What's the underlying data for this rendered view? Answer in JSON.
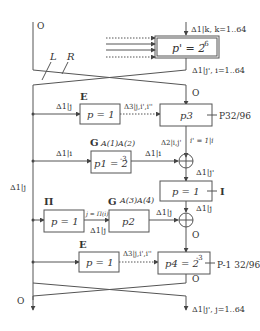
{
  "diagram": {
    "type": "differential-characteristic-round",
    "top_block": {
      "label": "p' = 2",
      "exp": "-6",
      "input_delta": "Δ1|k, k=1..64",
      "output_delta": "Δ1|j', i=1..64"
    },
    "labels": {
      "O_top_left": "O",
      "L": "L",
      "R": "R",
      "O_right_top": "O",
      "O_bottom_left": "O",
      "O_bottom_right": "O",
      "O_after_sum": "O",
      "left_delta": "Δ1|j"
    },
    "blocks": [
      {
        "id": "E1",
        "tag": "E",
        "label": "p = 1",
        "in": "Δ1|j",
        "out": "Δ3|j,i',i''"
      },
      {
        "id": "P3",
        "label": "p3",
        "side": "P32/96"
      },
      {
        "id": "G1",
        "tag": "G",
        "tag_extra": "A(1)A(2)",
        "label": "p1 = 2",
        "exp": "-3",
        "in": "Δ1|i",
        "out": "Δ1|i"
      },
      {
        "id": "I",
        "label": "p = 1",
        "side": "I"
      },
      {
        "id": "Pi",
        "tag": "Π",
        "label": "p = 1",
        "out": "j = Π(i)",
        "below": "Δ1|j"
      },
      {
        "id": "G2",
        "tag": "G",
        "tag_extra": "A(3)A(4)",
        "label": "p2",
        "out": "Δ1|j"
      },
      {
        "id": "E2",
        "tag": "E",
        "label": "p = 1",
        "in": "Δ1|j",
        "out": "Δ3|j,i',i''"
      },
      {
        "id": "P4",
        "label": "p4 = 2",
        "exp": "-3",
        "side": "P-1 32/96"
      }
    ],
    "mid_labels": {
      "d2": "Δ2|i,j'",
      "i_eq": "i' = 1|i",
      "d1j_prime": "Δ1|j'",
      "d1j": "Δ1|j"
    },
    "bottom_delta": "Δ1|j', j=1..64"
  }
}
